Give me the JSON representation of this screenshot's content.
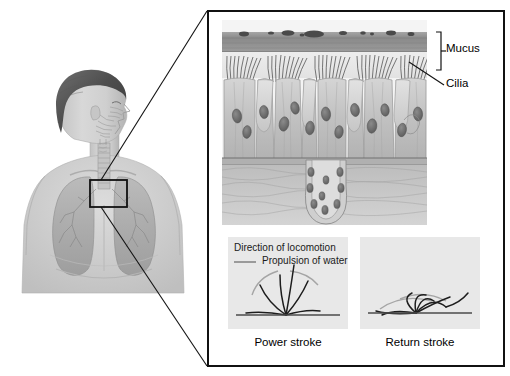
{
  "figure": {
    "domain_note": "anatomical illustration, grayscale"
  },
  "body_panel": {
    "name": "human-upper-body-anatomy",
    "description": "Grayscale illustration of human head in profile and upper torso showing nasal passages, trachea, bronchi and lungs",
    "callout_box_label": "trachea-detail-region"
  },
  "detail_frame": {
    "name": "magnified-detail-frame",
    "border_color": "#111111"
  },
  "epithelium": {
    "name": "ciliated-pseudostratified-epithelium",
    "layers": [
      "mucus",
      "cilia",
      "columnar epithelial cells",
      "goblet cells",
      "basement membrane",
      "submucosal gland"
    ],
    "mucus_color": "#8d8d8d",
    "cell_color": "#c9c9c9"
  },
  "labels": {
    "mucus": "Mucus",
    "cilia": "Cilia"
  },
  "legend": {
    "direction_of_locomotion": "Direction of locomotion",
    "propulsion_of_water": "Propulsion of water",
    "rule_color": "#9a9a9a"
  },
  "stroke_panels": [
    {
      "id": "power",
      "caption": "Power stroke",
      "background": "#e8e8e8",
      "description": "Cilia extended and sweeping in a wide arc, fanned out from a common basal anchor point"
    },
    {
      "id": "return",
      "caption": "Return stroke",
      "background": "#e8e8e8",
      "description": "Cilia bent low and close to the cell surface as they recover"
    }
  ],
  "colors": {
    "frame": "#111111",
    "panel_bg": "#e8e8e8",
    "text": "#000000",
    "gray_rule": "#9a9a9a",
    "mucus_band": "#8d8d8d"
  }
}
